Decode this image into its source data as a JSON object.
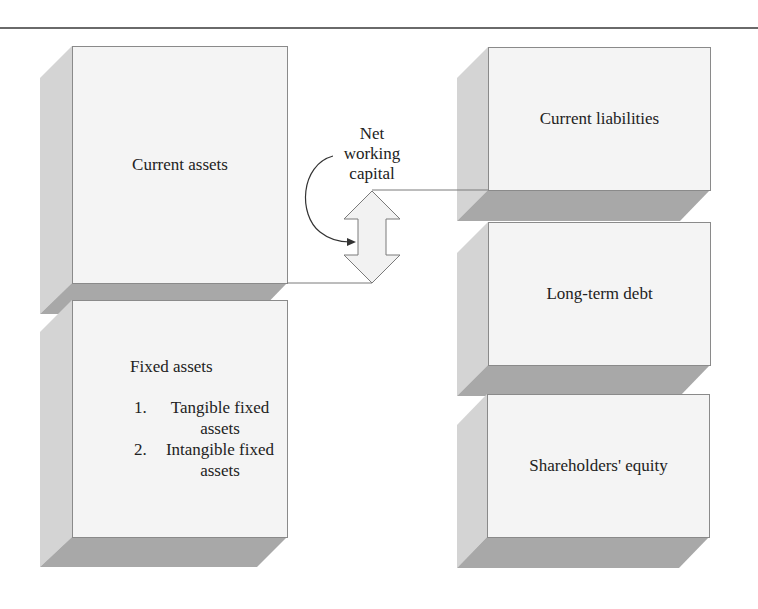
{
  "diagram": {
    "left_side": {
      "current_assets": {
        "label": "Current assets"
      },
      "fixed_assets": {
        "label": "Fixed assets",
        "items": [
          "Tangible fixed assets",
          "Intangible fixed assets"
        ]
      }
    },
    "right_side": {
      "current_liabilities": {
        "label": "Current liabilities"
      },
      "long_term_debt": {
        "label": "Long-term debt"
      },
      "shareholders_equity": {
        "label": "Shareholders' equity"
      }
    },
    "connector": {
      "label_lines": [
        "Net",
        "working",
        "capital"
      ],
      "icon": "double-headed-vertical-arrow"
    }
  },
  "colors": {
    "box_fill": "#f4f4f4",
    "box_border": "#8a8a8a",
    "shadow_side": "#d4d4d4",
    "shadow_bottom": "#a8a8a8",
    "rule": "#6a6a6a"
  }
}
